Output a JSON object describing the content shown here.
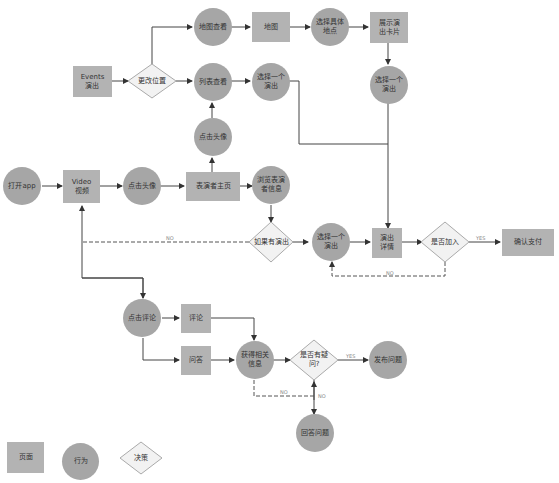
{
  "diagram": {
    "pages": {
      "events": "Events\n演出",
      "map": "地图",
      "show_card": "展示演\n出卡片",
      "video": "Video\n视频",
      "performer_home": "表演者主页",
      "show_detail": "演出\n详情",
      "confirm_pay": "确认支付",
      "comment": "评论",
      "qa": "问答"
    },
    "actions": {
      "map_view": "地图查看",
      "choose_location": "选择具体\n地点",
      "list_view": "列表查看",
      "choose_show_1": "选择一个\n演出",
      "choose_show_2": "选择一个\n演出",
      "click_avatar_up": "点击头像",
      "open_app": "打开app",
      "click_avatar": "点击头像",
      "browse_info": "浏览表演\n者信息",
      "choose_show_3": "选择一个\n演出",
      "click_comment": "点击评论",
      "get_info": "获得相关\n信息",
      "post_question": "发布问题",
      "answer_question": "回答问题"
    },
    "decisions": {
      "change_location": "更改位置",
      "has_show": "如果有演出",
      "join": "是否加入",
      "has_question": "是否有疑\n问?"
    },
    "edge_labels": {
      "no_has_show": "NO",
      "yes_join": "YES",
      "no_join": "NO",
      "yes_question": "YES",
      "no_question_left": "NO",
      "no_question_right": "NO"
    },
    "legend": {
      "page": "页面",
      "action": "行为",
      "decision": "决策"
    },
    "colors": {
      "page": "#b3b3b3",
      "action": "#a6a6a6",
      "decision_fill": "#f2f2f2",
      "line": "#333333"
    }
  }
}
